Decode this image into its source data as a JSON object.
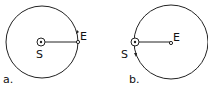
{
  "panels": [
    {
      "label": "a.",
      "center_body": "S",
      "orbiting_body": "E",
      "description": "Earth orbits the Sun"
    },
    {
      "label": "b.",
      "center_body": "E",
      "orbiting_body": "S",
      "description": "Sun orbits the Earth"
    }
  ],
  "colors": {
    "stroke": "#222222",
    "background": "#ffffff"
  }
}
